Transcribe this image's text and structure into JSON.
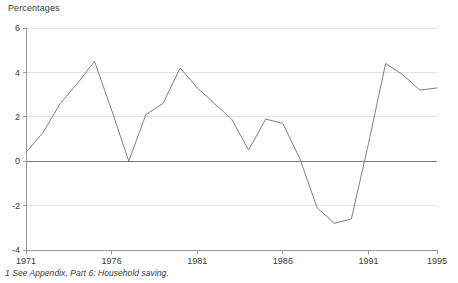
{
  "chart_data": {
    "type": "line",
    "title": "Percentages",
    "xlabel": "",
    "ylabel": "Percentages",
    "ylim": [
      -4,
      6
    ],
    "xlim": [
      1971,
      1995
    ],
    "grid": true,
    "legend": null,
    "yticks": [
      6,
      4,
      2,
      0,
      -2,
      -4
    ],
    "ytick_labels": [
      "6",
      "4",
      "2",
      "0",
      "-2",
      "-4"
    ],
    "xticks": [
      1971,
      1976,
      1981,
      1986,
      1991,
      1995
    ],
    "xtick_labels": [
      "1971",
      "1976",
      "1981",
      "1986",
      "1991",
      "1995"
    ],
    "x": [
      1971,
      1972,
      1973,
      1974,
      1975,
      1976,
      1977,
      1978,
      1979,
      1980,
      1981,
      1982,
      1983,
      1984,
      1985,
      1986,
      1987,
      1988,
      1989,
      1990,
      1991,
      1992,
      1993,
      1994,
      1995
    ],
    "series": [
      {
        "name": "Household saving",
        "color": "#808080",
        "values": [
          0.4,
          1.3,
          2.6,
          3.5,
          4.5,
          2.3,
          0.0,
          2.1,
          2.6,
          4.2,
          3.3,
          2.6,
          1.9,
          0.5,
          1.9,
          1.7,
          0.1,
          -2.1,
          -2.8,
          -2.6,
          0.8,
          4.4,
          3.9,
          3.2,
          3.3
        ]
      }
    ],
    "annotations": {
      "footnote": "1 See Appendix, Part 6: Household saving."
    },
    "colors": {
      "line": "#808080",
      "grid": "#e2e2e2",
      "axis": "#999999",
      "zero_line": "#7a7a7a",
      "text": "#3a3a3a",
      "background": "#ffffff"
    }
  },
  "header": {
    "axis_title": "Percentages"
  },
  "footer": {
    "footnote": "1 See Appendix, Part 6: Household saving."
  }
}
